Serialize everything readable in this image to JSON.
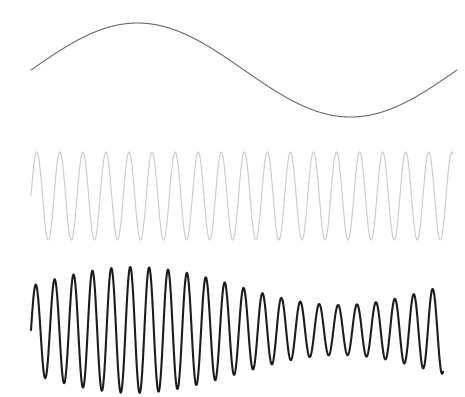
{
  "figure": {
    "background_color": "#ffffff",
    "width": 465,
    "height": 397
  },
  "chart_data": {
    "type": "line",
    "subtitle": "",
    "xlabel": "",
    "ylabel": "",
    "xlim": [
      0,
      465
    ],
    "ylim": [
      0,
      397
    ],
    "grid": false,
    "axes_visible": false,
    "tick_labels_visible": false,
    "legend": false,
    "legend_position": "none",
    "annotations": [],
    "series": [
      {
        "name": "modulating-signal",
        "description": "Smooth low-frequency sine wave (message / envelope signal)",
        "color": "#666666",
        "stroke_width": 1.1,
        "waveform": "sine",
        "x_start": 31,
        "x_end": 457,
        "center_y": 70,
        "amplitude": 47,
        "cycles": 1.0,
        "phase_deg": 0,
        "amplitude_modulated": false,
        "peak_point": [
          145,
          23
        ],
        "trough_point": [
          366,
          117
        ],
        "start_point": [
          31,
          72
        ],
        "end_point": [
          457,
          95
        ]
      },
      {
        "name": "carrier-signal",
        "description": "High-frequency constant-amplitude sine wave (carrier)",
        "color": "#c9c9c9",
        "stroke_width": 1.1,
        "waveform": "sine",
        "x_start": 31,
        "x_end": 453,
        "center_y": 196,
        "amplitude": 44,
        "cycles": 18.3,
        "phase_deg": 0,
        "amplitude_modulated": false,
        "peak_y": 152,
        "trough_y": 240
      },
      {
        "name": "modulated-signal",
        "description": "Amplitude-modulated carrier; envelope follows the modulating signal",
        "color": "#1c1c1c",
        "stroke_width": 2.1,
        "waveform": "sine",
        "x_start": 31,
        "x_end": 443,
        "center_y": 330,
        "amplitude_max": 63,
        "amplitude_min": 25,
        "cycles": 21.8,
        "phase_deg": 0,
        "amplitude_modulated": true,
        "envelope_cycles": 1.0,
        "envelope_phase_deg": 0,
        "envelope_peak_x": 150,
        "envelope_trough_x": 366,
        "peak_y_at_max": 267,
        "trough_y_at_max": 393
      }
    ]
  }
}
